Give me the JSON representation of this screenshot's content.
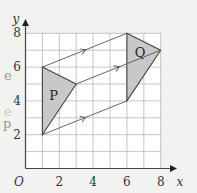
{
  "diagram": {
    "axes": {
      "x_label": "x",
      "y_label": "y",
      "origin_label": "O",
      "x_ticks": [
        "2",
        "4",
        "6",
        "8"
      ],
      "y_ticks": [
        "2",
        "4",
        "6",
        "8"
      ],
      "x_range": [
        0,
        8
      ],
      "y_range": [
        0,
        8
      ]
    },
    "shapes": [
      {
        "label": "P",
        "vertices": [
          [
            1,
            6
          ],
          [
            3,
            5
          ],
          [
            1,
            2
          ]
        ],
        "fill": "#c8c8c8"
      },
      {
        "label": "Q",
        "vertices": [
          [
            6,
            8
          ],
          [
            8,
            7
          ],
          [
            6,
            4
          ]
        ],
        "fill": "#c8c8c8"
      }
    ],
    "translation_lines": [
      {
        "from": [
          1,
          6
        ],
        "to": [
          6,
          8
        ]
      },
      {
        "from": [
          3,
          5
        ],
        "to": [
          8,
          7
        ]
      },
      {
        "from": [
          1,
          2
        ],
        "to": [
          6,
          4
        ]
      }
    ],
    "colors": {
      "background": "#f2f2f0",
      "grid": "#b8b8b8",
      "lines": "#555555",
      "shape_fill": "#c8c8c8"
    }
  },
  "side_text": [
    "e",
    "e",
    "p"
  ]
}
